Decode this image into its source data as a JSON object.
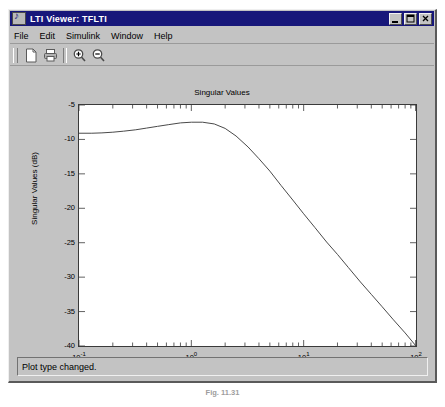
{
  "window": {
    "title": "LTI Viewer: TFLTI",
    "icon": "music-note-icon",
    "minimize_label": "_",
    "maximize_label": "□",
    "close_label": "×"
  },
  "menu": {
    "items": [
      {
        "label": "File",
        "name": "menu-file"
      },
      {
        "label": "Edit",
        "name": "menu-edit"
      },
      {
        "label": "Simulink",
        "name": "menu-simulink"
      },
      {
        "label": "Window",
        "name": "menu-window"
      },
      {
        "label": "Help",
        "name": "menu-help"
      }
    ]
  },
  "toolbar": {
    "buttons": [
      {
        "name": "new-document-icon",
        "title": "New"
      },
      {
        "name": "print-icon",
        "title": "Print"
      },
      {
        "name": "zoom-in-icon",
        "title": "Zoom In"
      },
      {
        "name": "zoom-out-icon",
        "title": "Zoom Out"
      }
    ]
  },
  "status": {
    "message": "Plot type changed."
  },
  "caption": {
    "text": "Fig. 11.31"
  },
  "colors": {
    "titlebar": "#17177a",
    "face": "#c3c3c3",
    "plot_bg": "#ffffff",
    "curve": "#4a4a4a",
    "axis": "#3a3a3a"
  },
  "chart_data": {
    "type": "line",
    "title": "Singular Values",
    "xlabel": "Frequency (rad/sec)",
    "ylabel": "Singular Values (dB)",
    "xscale": "log",
    "xlim": [
      0.1,
      100
    ],
    "ylim": [
      -40,
      -5
    ],
    "grid": false,
    "legend": null,
    "xticks": [
      {
        "value": 0.1,
        "label": "10",
        "exp": "-1"
      },
      {
        "value": 1,
        "label": "10",
        "exp": "0"
      },
      {
        "value": 10,
        "label": "10",
        "exp": "1"
      },
      {
        "value": 100,
        "label": "10",
        "exp": "2"
      }
    ],
    "yticks": [
      -5,
      -10,
      -15,
      -20,
      -25,
      -30,
      -35,
      -40
    ],
    "series": [
      {
        "name": "Singular Values",
        "x": [
          0.1,
          0.13,
          0.16,
          0.2,
          0.25,
          0.32,
          0.4,
          0.5,
          0.63,
          0.8,
          1.0,
          1.26,
          1.6,
          2.0,
          2.5,
          3.2,
          4.0,
          5.0,
          6.3,
          8.0,
          10.0,
          12.6,
          16.0,
          20.0,
          25.0,
          32.0,
          40.0,
          50.0,
          63.0,
          80.0,
          100.0
        ],
        "y": [
          -9.1,
          -9.1,
          -9.05,
          -8.95,
          -8.8,
          -8.6,
          -8.35,
          -8.1,
          -7.85,
          -7.6,
          -7.5,
          -7.5,
          -7.75,
          -8.4,
          -9.5,
          -11.1,
          -12.8,
          -14.6,
          -16.7,
          -18.8,
          -20.8,
          -22.8,
          -24.9,
          -26.7,
          -28.6,
          -30.7,
          -32.5,
          -34.3,
          -36.2,
          -38.1,
          -40.0
        ]
      }
    ]
  }
}
